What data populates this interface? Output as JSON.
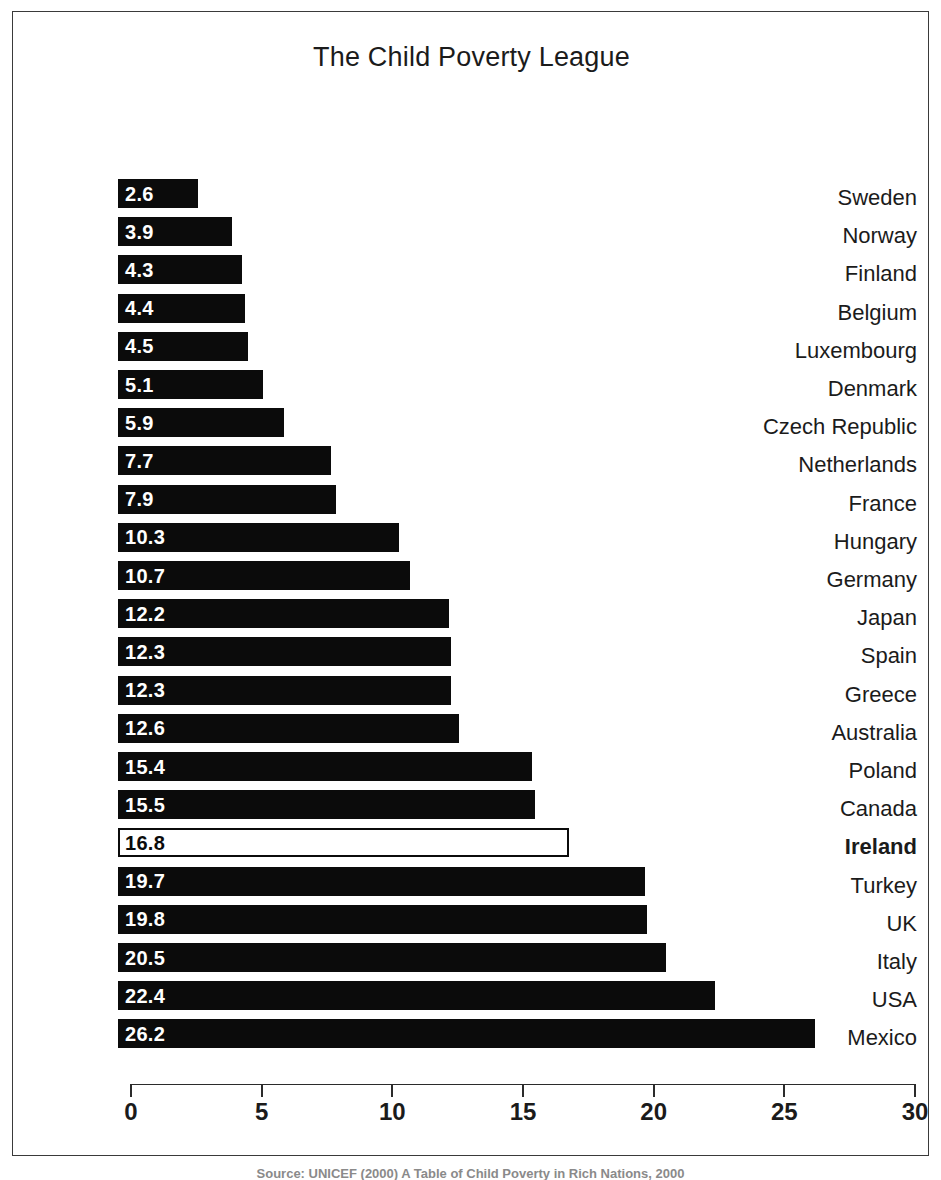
{
  "chart_data": {
    "type": "bar",
    "orientation": "horizontal",
    "title": "The Child Poverty League",
    "xlabel": "",
    "ylabel": "",
    "xlim": [
      0,
      30
    ],
    "grid": false,
    "legend": null,
    "x_ticks": [
      0,
      5,
      10,
      15,
      20,
      25,
      30
    ],
    "x_tick_labels": [
      "0",
      "5",
      "10",
      "15",
      "20",
      "25",
      "30"
    ],
    "categories": [
      "Sweden",
      "Norway",
      "Finland",
      "Belgium",
      "Luxembourg",
      "Denmark",
      "Czech Republic",
      "Netherlands",
      "France",
      "Hungary",
      "Germany",
      "Japan",
      "Spain",
      "Greece",
      "Australia",
      "Poland",
      "Canada",
      "Ireland",
      "Turkey",
      "UK",
      "Italy",
      "USA",
      "Mexico"
    ],
    "values": [
      2.6,
      3.9,
      4.3,
      4.4,
      4.5,
      5.1,
      5.9,
      7.7,
      7.9,
      10.3,
      10.7,
      12.2,
      12.3,
      12.3,
      12.6,
      15.4,
      15.5,
      16.8,
      19.7,
      19.8,
      20.5,
      22.4,
      26.2
    ],
    "value_labels": [
      "2.6",
      "3.9",
      "4.3",
      "4.4",
      "4.5",
      "5.1",
      "5.9",
      "7.7",
      "7.9",
      "10.3",
      "10.7",
      "12.2",
      "12.3",
      "12.3",
      "12.6",
      "15.4",
      "15.5",
      "16.8",
      "19.7",
      "19.8",
      "20.5",
      "22.4",
      "26.2"
    ],
    "highlighted_category": "Ireland",
    "colors": {
      "bar_fill": "#0b0b0b",
      "bar_highlight_fill": "#ffffff",
      "bar_highlight_border": "#0b0b0b",
      "value_text": "#ffffff",
      "value_text_highlight": "#0b0b0b",
      "label_text": "#1b1b1b",
      "axis": "#2b2b2b",
      "frame": "#3a3a3a",
      "background": "#ffffff"
    }
  },
  "caption": {
    "source": "Source: UNICEF (2000) A Table of Child Poverty in Rich Nations, 2000"
  }
}
